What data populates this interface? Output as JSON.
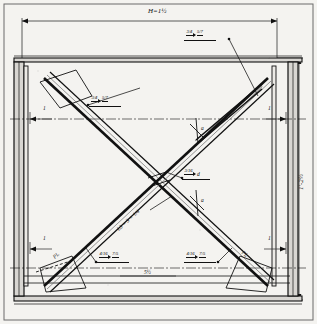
{
  "drawing": {
    "title": "Structural steel X-bracing connection detail",
    "type": "engineering-drawing",
    "paper_color": "#f4f3f0",
    "ink_color": "#111111",
    "width_px": 317,
    "height_px": 324
  },
  "dimensions": {
    "top_overall": {
      "label": "H=1½",
      "position": "top-center"
    },
    "right_overall": {
      "label": "1'-2½",
      "position": "right-vertical"
    },
    "bottom_center": {
      "label": "5½",
      "position": "bottom-center"
    },
    "left_offset": {
      "label": "1",
      "position": "left-inner"
    },
    "right_offset": {
      "label": "1",
      "position": "right-inner"
    },
    "left_lower_offset": {
      "label": "1",
      "position": "left-lower"
    },
    "right_lower_offset": {
      "label": "1",
      "position": "right-lower"
    }
  },
  "welds": [
    {
      "id": "weld-top-right",
      "size": "3/4",
      "length": "5/7",
      "symbol": "fillet-weld"
    },
    {
      "id": "weld-upper-left",
      "size": "3/4",
      "length": "5/7",
      "symbol": "fillet-weld"
    },
    {
      "id": "weld-center",
      "size": "3/16",
      "length": "d",
      "symbol": "fillet-weld"
    },
    {
      "id": "weld-lower-left",
      "size": "4/16",
      "length": "7/5",
      "symbol": "fillet-weld"
    },
    {
      "id": "weld-lower-right",
      "size": "4/16",
      "length": "7/5",
      "symbol": "fillet-weld"
    }
  ],
  "members": {
    "brace_note": {
      "label": "L3 × 3 × 1/4",
      "position": "diagonal-lower-left"
    },
    "gusset_left": {
      "label": "PL",
      "position": "bottom-left"
    },
    "gusset_right": {
      "label": "PL",
      "position": "bottom-right"
    },
    "brace_mark_left": {
      "label": "a",
      "position": "diagonal-upper-right"
    },
    "brace_mark_right": {
      "label": "a",
      "position": "diagonal-lower-right"
    }
  },
  "components": {
    "left_column": "vertical-steel-column",
    "right_column": "vertical-steel-column",
    "top_beam": "horizontal-top-beam",
    "bottom_beam": "horizontal-bottom-beam",
    "diagonal_a": "brace-top-left-to-bottom-right",
    "diagonal_b": "brace-bottom-left-to-top-right",
    "centerline": "horizontal-centerline"
  }
}
